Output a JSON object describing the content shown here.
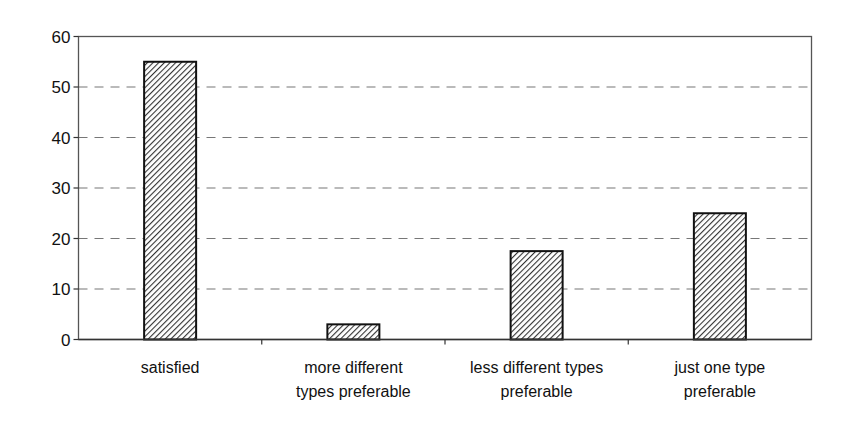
{
  "chart_data": {
    "type": "bar",
    "title": "",
    "xlabel": "",
    "ylabel": "",
    "categories": [
      [
        "satisfied"
      ],
      [
        "more different",
        "types preferable"
      ],
      [
        "less different types",
        "preferable"
      ],
      [
        "just one type",
        "preferable"
      ]
    ],
    "values": [
      55,
      3,
      17.5,
      25
    ],
    "ylim": [
      0,
      60
    ],
    "yticks": [
      0,
      10,
      20,
      30,
      40,
      50,
      60
    ],
    "grid": "horizontal dashed",
    "legend": "none",
    "bar_fill": "diagonal hatch",
    "colors": {
      "bar_stroke": "#111111",
      "hatch": "#333333",
      "grid": "#777777",
      "frame": "#555555"
    }
  }
}
